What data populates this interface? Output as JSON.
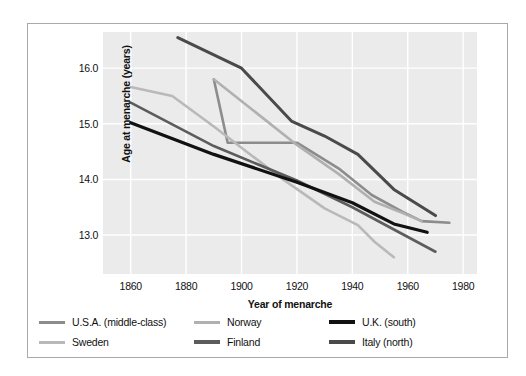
{
  "chart_data": {
    "type": "line",
    "title": "",
    "xlabel": "Year of menarche",
    "ylabel": "Age at menarche (years)",
    "xlim": [
      1850,
      1985
    ],
    "ylim": [
      12.3,
      16.65
    ],
    "xticks": [
      "1860",
      "1880",
      "1900",
      "1920",
      "1940",
      "1960",
      "1980"
    ],
    "xtick_values": [
      1860,
      1880,
      1900,
      1920,
      1940,
      1960,
      1980
    ],
    "yticks": [
      "13.0",
      "14.0",
      "15.0",
      "16.0"
    ],
    "ytick_values": [
      13.0,
      14.0,
      15.0,
      16.0
    ],
    "grid": true,
    "legend_position": "below",
    "series": [
      {
        "name": "U.S.A. (middle-class)",
        "color": "#8c8c8c",
        "width": 2.6,
        "x": [
          1890,
          1895,
          1920,
          1935,
          1947,
          1958,
          1965,
          1975
        ],
        "y": [
          15.8,
          14.66,
          14.66,
          14.2,
          13.72,
          13.42,
          13.25,
          13.22
        ]
      },
      {
        "name": "Sweden",
        "color": "#b9b9b9",
        "width": 2.6,
        "x": [
          1860,
          1875,
          1890,
          1915,
          1930,
          1942,
          1948,
          1955
        ],
        "y": [
          15.66,
          15.5,
          14.95,
          14.0,
          13.48,
          13.18,
          12.88,
          12.6
        ]
      },
      {
        "name": "Norway",
        "color": "#b0b0b0",
        "width": 2.6,
        "x": [
          1890,
          1920,
          1935,
          1948,
          1958,
          1965
        ],
        "y": [
          15.8,
          14.62,
          14.1,
          13.6,
          13.4,
          13.25
        ]
      },
      {
        "name": "Finland",
        "color": "#5c5c5c",
        "width": 2.6,
        "x": [
          1860,
          1890,
          1920,
          1940,
          1955,
          1970
        ],
        "y": [
          15.38,
          14.6,
          13.98,
          13.5,
          13.1,
          12.7
        ]
      },
      {
        "name": "U.K. (south)",
        "color": "#111111",
        "width": 3.2,
        "x": [
          1860,
          1890,
          1920,
          1940,
          1955,
          1967
        ],
        "y": [
          15.02,
          14.45,
          13.95,
          13.58,
          13.2,
          13.05
        ]
      },
      {
        "name": "Italy (north)",
        "color": "#4a4a4a",
        "width": 3.0,
        "x": [
          1877,
          1900,
          1918,
          1930,
          1942,
          1955,
          1970
        ],
        "y": [
          16.55,
          16.0,
          15.05,
          14.78,
          14.45,
          13.82,
          13.35
        ]
      }
    ]
  },
  "legend": {
    "items": [
      {
        "label": "U.S.A. (middle-class)",
        "color": "#8c8c8c",
        "height": 3
      },
      {
        "label": "Norway",
        "color": "#b0b0b0",
        "height": 3
      },
      {
        "label": "U.K. (south)",
        "color": "#111111",
        "height": 4
      },
      {
        "label": "Sweden",
        "color": "#b9b9b9",
        "height": 3
      },
      {
        "label": "Finland",
        "color": "#5c5c5c",
        "height": 3.5
      },
      {
        "label": "Italy (north)",
        "color": "#4a4a4a",
        "height": 3.5
      }
    ]
  },
  "colors": {
    "plot_background": "#ebebeb",
    "gridline": "#ffffff",
    "frame_border": "#a9a9ac",
    "page_background": "#ffffff",
    "text": "#111111"
  }
}
